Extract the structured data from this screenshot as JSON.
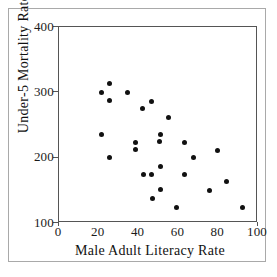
{
  "chart_data": {
    "type": "scatter",
    "title": "",
    "xlabel": "Male Adult Literacy Rate",
    "ylabel": "Under-5 Mortality Rate",
    "xlim": [
      0,
      100
    ],
    "ylim": [
      100,
      400
    ],
    "xticks": [
      0,
      20,
      40,
      60,
      80,
      100
    ],
    "yticks": [
      100,
      200,
      300,
      400
    ],
    "xtick_labels": [
      "0",
      "20",
      "40",
      "60",
      "80",
      "100"
    ],
    "ytick_labels": [
      "100",
      "200",
      "300",
      "400"
    ],
    "grid": false,
    "legend": null,
    "marker": "filled-circle",
    "marker_color": "#111111",
    "points": [
      {
        "x": 25.6,
        "y": 313
      },
      {
        "x": 21.5,
        "y": 300
      },
      {
        "x": 34.3,
        "y": 299
      },
      {
        "x": 25.5,
        "y": 287
      },
      {
        "x": 46.6,
        "y": 286
      },
      {
        "x": 41.9,
        "y": 276
      },
      {
        "x": 54.8,
        "y": 262
      },
      {
        "x": 21.5,
        "y": 236
      },
      {
        "x": 50.8,
        "y": 236
      },
      {
        "x": 38.2,
        "y": 223
      },
      {
        "x": 50.6,
        "y": 224
      },
      {
        "x": 63.3,
        "y": 223
      },
      {
        "x": 38.2,
        "y": 212
      },
      {
        "x": 79.7,
        "y": 211
      },
      {
        "x": 25.6,
        "y": 200
      },
      {
        "x": 67.7,
        "y": 200
      },
      {
        "x": 51.0,
        "y": 187
      },
      {
        "x": 42.4,
        "y": 175
      },
      {
        "x": 46.7,
        "y": 175
      },
      {
        "x": 63.3,
        "y": 175
      },
      {
        "x": 84.1,
        "y": 163
      },
      {
        "x": 51.0,
        "y": 151
      },
      {
        "x": 75.7,
        "y": 150
      },
      {
        "x": 46.9,
        "y": 137
      },
      {
        "x": 59.1,
        "y": 124
      },
      {
        "x": 92.3,
        "y": 123
      }
    ]
  },
  "figure": {
    "background_color": "#ffffff",
    "border_color": "#a9a9a9",
    "axis_color": "#555555"
  }
}
